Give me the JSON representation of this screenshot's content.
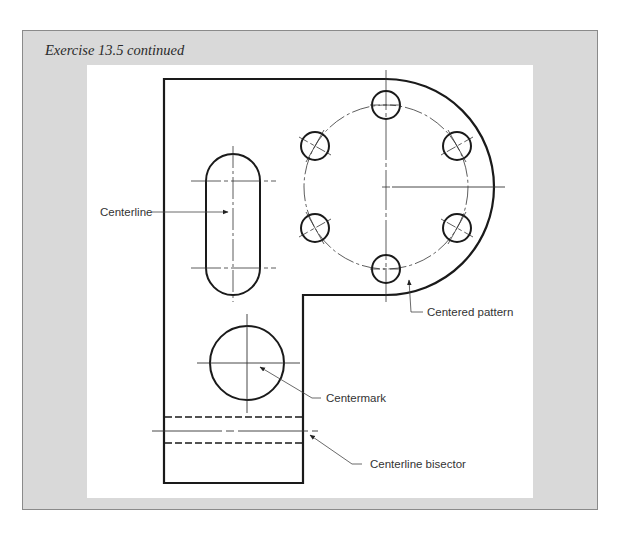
{
  "header": {
    "title": "Exercise 13.5 continued"
  },
  "drawing": {
    "callouts": [
      {
        "id": "centerline",
        "label": "Centerline"
      },
      {
        "id": "centered-pattern",
        "label": "Centered pattern"
      },
      {
        "id": "centermark",
        "label": "Centermark"
      },
      {
        "id": "centerline-bisector",
        "label": "Centerline bisector"
      }
    ],
    "features": {
      "slot": "obround slot with centerlines",
      "bolt_circle": "6-hole centered pattern on dashed bolt circle",
      "large_hole": "circle with centermark",
      "hidden_bore": "hidden lines with centerline bisector"
    }
  },
  "colors": {
    "frame_bg": "#d9d9d9",
    "panel_bg": "#ffffff",
    "line": "#1a1a1a",
    "thin_line": "#333333"
  }
}
